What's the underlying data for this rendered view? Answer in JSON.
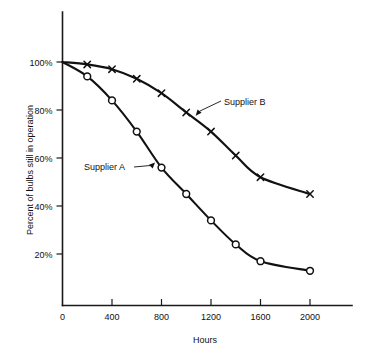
{
  "chart_data": {
    "type": "line",
    "title": "",
    "xlabel": "Hours",
    "ylabel": "Percent of bulbs still in operation",
    "xlim": [
      0,
      2200
    ],
    "ylim": [
      0,
      108
    ],
    "grid": false,
    "legend_position": "inline-annotation",
    "x_ticks": [
      {
        "value": 0,
        "label": "0"
      },
      {
        "value": 400,
        "label": "400"
      },
      {
        "value": 800,
        "label": "800"
      },
      {
        "value": 1200,
        "label": "1200"
      },
      {
        "value": 1600,
        "label": "1600"
      },
      {
        "value": 2000,
        "label": "2000"
      }
    ],
    "y_ticks": [
      {
        "value": 20,
        "label": "20%"
      },
      {
        "value": 40,
        "label": "40%"
      },
      {
        "value": 60,
        "label": "60%"
      },
      {
        "value": 80,
        "label": "80%"
      },
      {
        "value": 100,
        "label": "100%"
      }
    ],
    "x": [
      0,
      200,
      400,
      600,
      800,
      1000,
      1200,
      1400,
      1600,
      2000
    ],
    "series": [
      {
        "name": "Supplier A",
        "marker": "circle",
        "values": [
          100,
          94,
          84,
          71,
          56,
          45,
          34,
          24,
          17,
          13
        ]
      },
      {
        "name": "Supplier B",
        "marker": "x",
        "values": [
          100,
          99,
          97,
          93,
          87,
          79,
          71,
          61,
          52,
          45
        ]
      }
    ],
    "annotations": [
      {
        "text": "Supplier A",
        "points_to_series": "Supplier A",
        "points_to_x": 760
      },
      {
        "text": "Supplier B",
        "points_to_series": "Supplier B",
        "points_to_x": 1060
      }
    ]
  }
}
